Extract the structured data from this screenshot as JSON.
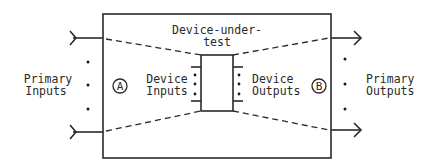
{
  "diagram": {
    "type": "block-diagram",
    "colors": {
      "stroke": "#2a2a2a",
      "background": "#ffffff"
    },
    "labels": {
      "dut_line1": "Device-under-",
      "dut_line2": "test",
      "primary_inputs_line1": "Primary",
      "primary_inputs_line2": "Inputs",
      "primary_outputs_line1": "Primary",
      "primary_outputs_line2": "Outputs",
      "device_inputs_line1": "Device",
      "device_inputs_line2": "Inputs",
      "device_outputs_line1": "Device",
      "device_outputs_line2": "Outputs",
      "node_a": "A",
      "node_b": "B"
    },
    "nodes": [
      {
        "id": "outer-box",
        "label": "Test fixture / load board"
      },
      {
        "id": "dut",
        "label": "Device-under-test"
      },
      {
        "id": "A",
        "label": "A"
      },
      {
        "id": "B",
        "label": "B"
      }
    ],
    "edges": [
      {
        "from": "Primary Inputs",
        "to": "outer-box",
        "style": "arrow-in"
      },
      {
        "from": "outer-box",
        "to": "Primary Outputs",
        "style": "arrow-out"
      },
      {
        "from": "primary-input-lines",
        "to": "Device Inputs",
        "style": "dashed"
      },
      {
        "from": "Device Outputs",
        "to": "primary-output-lines",
        "style": "dashed"
      }
    ]
  }
}
